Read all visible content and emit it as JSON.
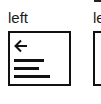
{
  "options": [
    {
      "label": "left",
      "icon": "arrow-left-icon",
      "lines": [
        30,
        25,
        36
      ]
    },
    {
      "label": "le",
      "label_above_fragment": ""
    }
  ],
  "colors": {
    "stroke": "#111111",
    "background": "#ffffff"
  }
}
